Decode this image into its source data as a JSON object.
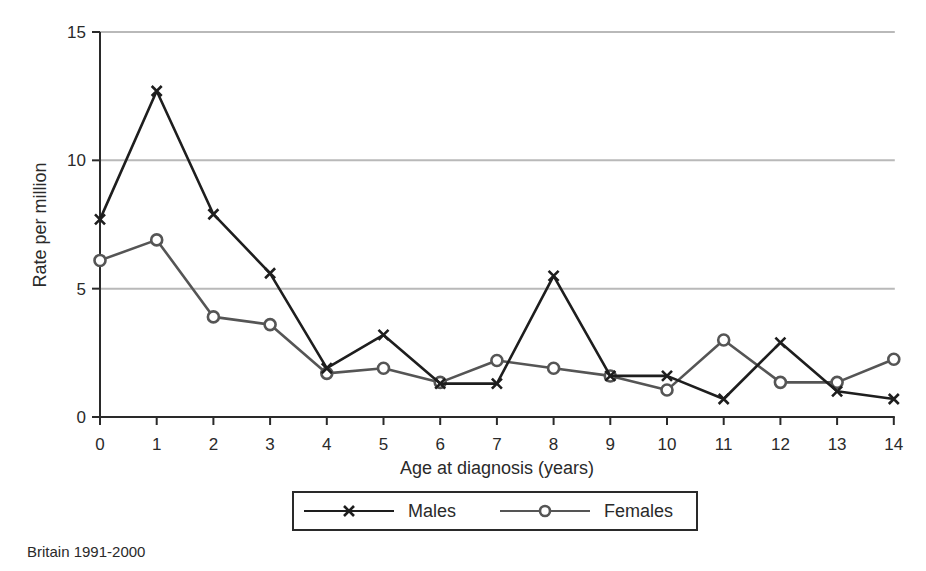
{
  "chart_data": {
    "type": "line",
    "title": "",
    "xlabel": "Age at diagnosis (years)",
    "ylabel": "Rate per million",
    "x": [
      0,
      1,
      2,
      3,
      4,
      5,
      6,
      7,
      8,
      9,
      10,
      11,
      12,
      13,
      14
    ],
    "xticks": [
      "0",
      "1",
      "2",
      "3",
      "4",
      "5",
      "6",
      "7",
      "8",
      "9",
      "10",
      "11",
      "12",
      "13",
      "14"
    ],
    "ylim": [
      0,
      15
    ],
    "yticks": [
      "0",
      "5",
      "10",
      "15"
    ],
    "grid": "horizontal",
    "legend_position": "bottom",
    "series": [
      {
        "name": "Males",
        "marker": "x",
        "color": "#1e1e1e",
        "values": [
          7.7,
          12.7,
          7.9,
          5.6,
          1.9,
          3.2,
          1.3,
          1.3,
          5.5,
          1.6,
          1.6,
          0.7,
          2.9,
          1.0,
          0.7
        ]
      },
      {
        "name": "Females",
        "marker": "circle",
        "color": "#555555",
        "values": [
          6.1,
          6.9,
          3.9,
          3.6,
          1.7,
          1.9,
          1.35,
          2.2,
          1.9,
          1.6,
          1.05,
          3.0,
          1.35,
          1.35,
          2.25
        ]
      }
    ],
    "caption": "Britain 1991-2000"
  },
  "legend": {
    "males_label": "Males",
    "females_label": "Females"
  },
  "caption": "Britain 1991-2000"
}
